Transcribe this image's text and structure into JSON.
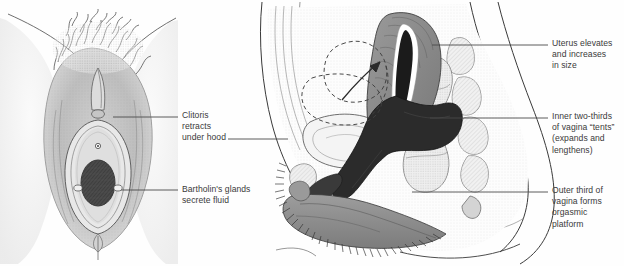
{
  "figure": {
    "background_color": "#fefefe",
    "width": 624,
    "height": 266
  },
  "palette": {
    "ink": "#2a2a2a",
    "text": "#3a3a3a",
    "leader_line": "#4a4a4a",
    "vagina_dark": "#2b2b2b",
    "uterus_gray": "#8a8a8a",
    "labia_gray": "#8f8f8f",
    "tissue_light": "#f2f2f2",
    "stipple": "#9a9a9a",
    "white": "#ffffff"
  },
  "panels": [
    {
      "id": "external-view",
      "name": "external-genitalia-anterior-view",
      "caption": "Anterior view of external female genitalia during arousal"
    },
    {
      "id": "sagittal-view",
      "name": "pelvic-sagittal-section",
      "caption": "Midsagittal section of female pelvis during arousal"
    }
  ],
  "labels": [
    {
      "id": "clitoris",
      "name": "label-clitoris-retracts",
      "lines": [
        "Clitoris",
        "retracts",
        "under hood"
      ],
      "text": "Clitoris\nretracts\nunder hood",
      "x": 182,
      "y": 110,
      "side": "left-panel"
    },
    {
      "id": "bartholins",
      "name": "label-bartholins-glands",
      "lines": [
        "Bartholin's glands",
        "secrete fluid"
      ],
      "text": "Bartholin's glands\nsecrete fluid",
      "x": 182,
      "y": 184,
      "side": "left-panel"
    },
    {
      "id": "uterus",
      "name": "label-uterus-elevates",
      "lines": [
        "Uterus elevates",
        "and increases",
        "in size"
      ],
      "text": "Uterus elevates\nand increases\nin size",
      "x": 552,
      "y": 38,
      "side": "right-panel"
    },
    {
      "id": "inner-vagina",
      "name": "label-inner-two-thirds-vagina",
      "lines": [
        "Inner two-thirds",
        "of vagina “tents”",
        "(expands and",
        "lengthens)"
      ],
      "text": "Inner two-thirds\nof vagina “tents”\n(expands and\nlengthens)",
      "x": 552,
      "y": 111,
      "side": "right-panel"
    },
    {
      "id": "outer-vagina",
      "name": "label-outer-third-vagina",
      "lines": [
        "Outer third of",
        "vagina forms",
        "orgasmic",
        "platform"
      ],
      "text": "Outer third of\nvagina forms\norgasmic\nplatform",
      "x": 552,
      "y": 185,
      "side": "right-panel"
    }
  ],
  "leaders": [
    {
      "id": "leader-clitoris",
      "name": "leader-line-clitoris",
      "x1": 113,
      "y1": 117,
      "x2": 178,
      "y2": 117
    },
    {
      "id": "leader-clitoris-tail",
      "name": "leader-line-clitoris-tail",
      "x1": 228,
      "y1": 139,
      "x2": 288,
      "y2": 139
    },
    {
      "id": "leader-bartholins",
      "name": "leader-line-bartholins",
      "x1": 121,
      "y1": 190,
      "x2": 178,
      "y2": 190
    },
    {
      "id": "leader-uterus",
      "name": "leader-line-uterus",
      "x1": 432,
      "y1": 45,
      "x2": 548,
      "y2": 45
    },
    {
      "id": "leader-inner-vagina",
      "name": "leader-line-inner-vagina",
      "x1": 430,
      "y1": 118,
      "x2": 548,
      "y2": 118
    },
    {
      "id": "leader-outer-vagina",
      "name": "leader-line-outer-vagina",
      "x1": 412,
      "y1": 192,
      "x2": 548,
      "y2": 192
    }
  ],
  "annotations": {
    "elevation_arrow": {
      "name": "uterus-elevation-arrow",
      "description": "Arrow indicating upward elevation of uterus"
    },
    "dashed_outline": {
      "name": "unaroused-uterus-dashed-outline",
      "description": "Dashed outline showing unaroused position of uterus and bladder"
    }
  }
}
